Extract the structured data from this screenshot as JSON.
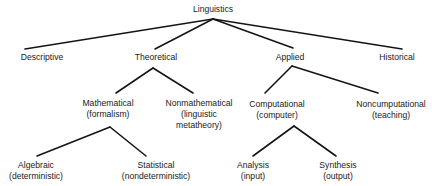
{
  "diagram": {
    "type": "tree",
    "root": "Linguistics",
    "nodes": {
      "linguistics": {
        "lines": [
          "Linguistics"
        ]
      },
      "descriptive": {
        "lines": [
          "Descriptive"
        ]
      },
      "theoretical": {
        "lines": [
          "Theoretical"
        ]
      },
      "applied": {
        "lines": [
          "Applied"
        ]
      },
      "historical": {
        "lines": [
          "Historical"
        ]
      },
      "mathematical": {
        "lines": [
          "Mathematical",
          "(formalism)"
        ]
      },
      "nonmathematical": {
        "lines": [
          "Nonmathematical",
          "(linguistic",
          "metatheory)"
        ]
      },
      "computational": {
        "lines": [
          "Computational",
          "(computer)"
        ]
      },
      "noncomputational": {
        "lines": [
          "Noncumputational",
          "(teaching)"
        ]
      },
      "algebraic": {
        "lines": [
          "Algebraic",
          "(deterministic)"
        ]
      },
      "statistical": {
        "lines": [
          "Statistical",
          "(nondeterministic)"
        ]
      },
      "analysis": {
        "lines": [
          "Analysis",
          "(input)"
        ]
      },
      "synthesis": {
        "lines": [
          "Synthesis",
          "(output)"
        ]
      }
    },
    "edges": [
      [
        "Linguistics",
        "Descriptive"
      ],
      [
        "Linguistics",
        "Theoretical"
      ],
      [
        "Linguistics",
        "Applied"
      ],
      [
        "Linguistics",
        "Historical"
      ],
      [
        "Theoretical",
        "Mathematical (formalism)"
      ],
      [
        "Theoretical",
        "Nonmathematical (linguistic metatheory)"
      ],
      [
        "Applied",
        "Computational (computer)"
      ],
      [
        "Applied",
        "Noncumputational (teaching)"
      ],
      [
        "Mathematical (formalism)",
        "Algebraic (deterministic)"
      ],
      [
        "Mathematical (formalism)",
        "Statistical (nondeterministic)"
      ],
      [
        "Computational (computer)",
        "Analysis (input)"
      ],
      [
        "Computational (computer)",
        "Synthesis (output)"
      ]
    ],
    "colors": {
      "line": "#151515",
      "text": "#1a1a1a",
      "background": "#ffffff"
    }
  }
}
